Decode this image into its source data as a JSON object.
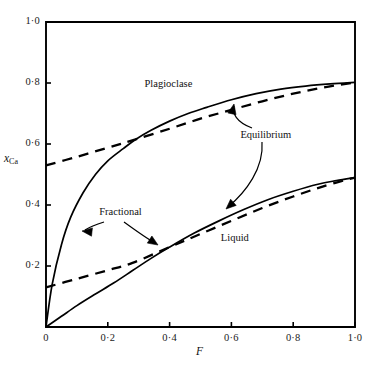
{
  "chart_data": {
    "type": "line",
    "title": "",
    "xlabel": "F",
    "ylabel": "xCa",
    "ylabel_var": "x",
    "ylabel_sub": "Ca",
    "xlim": [
      0,
      1
    ],
    "ylim": [
      0,
      1
    ],
    "grid": false,
    "legend_position": "inline-annotations",
    "x_tick_labels": [
      "0",
      "0·2",
      "0·4",
      "0·6",
      "0·8",
      "1·0"
    ],
    "x_tick_values": [
      0,
      0.2,
      0.4,
      0.6,
      0.8,
      1.0
    ],
    "y_tick_labels": [
      "0·2",
      "0·4",
      "0·6",
      "0·8",
      "1·0"
    ],
    "y_tick_values": [
      0.2,
      0.4,
      0.6,
      0.8,
      1.0
    ],
    "axis_color": "#000000",
    "curve_color": "#000000",
    "series": [
      {
        "name": "Fractional plagioclase",
        "style": "solid",
        "x": [
          0.0,
          0.02,
          0.05,
          0.08,
          0.12,
          0.16,
          0.2,
          0.25,
          0.29,
          0.34,
          0.4,
          0.46,
          0.52,
          0.6,
          0.68,
          0.76,
          0.84,
          0.92,
          1.0
        ],
        "y": [
          0.0,
          0.14,
          0.27,
          0.36,
          0.44,
          0.5,
          0.545,
          0.585,
          0.615,
          0.645,
          0.675,
          0.7,
          0.72,
          0.745,
          0.765,
          0.78,
          0.79,
          0.797,
          0.802
        ]
      },
      {
        "name": "Equilibrium plagioclase",
        "style": "dashed",
        "x": [
          0.0,
          0.1,
          0.2,
          0.29,
          0.4,
          0.5,
          0.6,
          0.7,
          0.8,
          0.9,
          1.0
        ],
        "y": [
          0.53,
          0.558,
          0.588,
          0.615,
          0.65,
          0.683,
          0.712,
          0.74,
          0.765,
          0.786,
          0.802
        ]
      },
      {
        "name": "Fractional liquid",
        "style": "solid",
        "x": [
          0.0,
          0.05,
          0.1,
          0.16,
          0.22,
          0.28,
          0.34,
          0.4,
          0.48,
          0.56,
          0.64,
          0.72,
          0.8,
          0.88,
          0.94,
          1.0
        ],
        "y": [
          0.0,
          0.035,
          0.07,
          0.108,
          0.145,
          0.185,
          0.225,
          0.262,
          0.308,
          0.348,
          0.385,
          0.418,
          0.445,
          0.468,
          0.48,
          0.49
        ]
      },
      {
        "name": "Equilibrium liquid",
        "style": "dashed",
        "x": [
          0.0,
          0.1,
          0.2,
          0.28,
          0.4,
          0.5,
          0.6,
          0.7,
          0.8,
          0.9,
          1.0
        ],
        "y": [
          0.13,
          0.158,
          0.186,
          0.21,
          0.262,
          0.305,
          0.348,
          0.39,
          0.428,
          0.462,
          0.49
        ]
      }
    ],
    "annotations": [
      {
        "name": "plagioclase",
        "text": "Plagioclase",
        "x": 0.38,
        "y": 0.795
      },
      {
        "name": "equilibrium",
        "text": "Equilibrium",
        "x": 0.695,
        "y": 0.625
      },
      {
        "name": "fractional",
        "text": "Fractional",
        "x": 0.225,
        "y": 0.375
      },
      {
        "name": "liquid",
        "text": "Liquid",
        "x": 0.595,
        "y": 0.29
      }
    ]
  }
}
